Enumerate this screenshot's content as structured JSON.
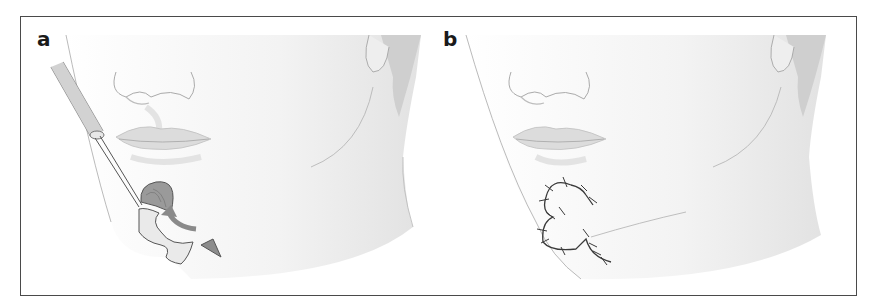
{
  "figure": {
    "panels": [
      {
        "label": "a",
        "description": "Surgical illustration: lower face with instrument elevating a flap near the chin; curved arrow indicating flap rotation"
      },
      {
        "label": "b",
        "description": "Same lower face after closure; sutured S-shaped incision line on chin extending to jawline"
      }
    ],
    "colors": {
      "border": "#4a4a4a",
      "label": "#1a1a1a",
      "skin_shade": "#d8d8d8",
      "arrow": "#8a8a8a",
      "suture": "#3a3a3a"
    }
  }
}
